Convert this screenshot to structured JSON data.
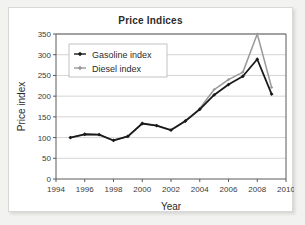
{
  "card": {
    "title": "Price Indices"
  },
  "chart_data": {
    "type": "line",
    "title": "Price Indices",
    "xlabel": "Year",
    "ylabel": "Price index",
    "xlim": [
      1994,
      2010
    ],
    "ylim": [
      0,
      350
    ],
    "xticks": [
      1994,
      1996,
      1998,
      2000,
      2002,
      2004,
      2006,
      2008,
      2010
    ],
    "yticks": [
      0,
      50,
      100,
      150,
      200,
      250,
      300,
      350
    ],
    "grid": "horizontal",
    "legend_position": "top-left-inside",
    "x": [
      1995,
      1996,
      1997,
      1998,
      1999,
      2000,
      2001,
      2002,
      2003,
      2004,
      2005,
      2006,
      2007,
      2008,
      2009
    ],
    "series": [
      {
        "name": "Gasoline index",
        "color": "#1a1a1a",
        "marker": "diamond",
        "values": [
          100,
          108,
          107,
          93,
          103,
          134,
          129,
          118,
          140,
          168,
          203,
          228,
          248,
          289,
          205
        ]
      },
      {
        "name": "Diesel index",
        "color": "#9a9a9a",
        "marker": "diamond",
        "values": [
          100,
          108,
          107,
          93,
          103,
          134,
          129,
          118,
          140,
          170,
          216,
          240,
          258,
          350,
          221
        ]
      }
    ]
  },
  "legend": {
    "items": [
      {
        "label": "Gasoline index",
        "color": "#1a1a1a"
      },
      {
        "label": "Diesel index",
        "color": "#9a9a9a"
      }
    ]
  },
  "colors": {
    "gasoline": "#1a1a1a",
    "diesel": "#9a9a9a",
    "grid": "#c9c9c9",
    "axis": "#5a5a5a",
    "card_bg": "#ffffff",
    "page_bg": "#f2f2f0"
  }
}
